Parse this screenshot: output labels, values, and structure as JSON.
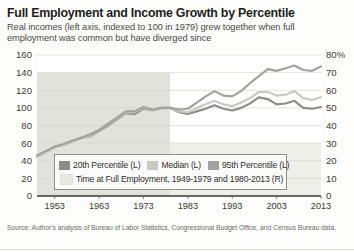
{
  "header": {
    "title": "Full Employment and Income Growth by Percentile",
    "subtitle": "Real incomes (left axis, indexed to 100 in 1979) grew together when full employment was common but have diverged since"
  },
  "source": {
    "text": "Source: Author's analysis of Bureau of Labor Statistics, Congressional Budget Office, and Census Bureau data."
  },
  "legend": {
    "items": [
      {
        "label": "20th Percentile (L)",
        "color": "#8d8d88"
      },
      {
        "label": "Median (L)",
        "color": "#c9c9c3"
      },
      {
        "label": "95th Percentile (L)",
        "color": "#a3a39d"
      },
      {
        "label": "Time at Full Employment, 1949-1979 and 1980-2013 (R)",
        "color": "#e8e8e2"
      }
    ]
  },
  "chart_data": {
    "type": "line",
    "title": "Full Employment and Income Growth by Percentile",
    "subtitle": "Real incomes (left axis, indexed to 100 in 1979) grew together when full employment was common but have diverged since",
    "xlabel": "",
    "ylabel": "",
    "y2label": "",
    "xlim": [
      1949,
      2013
    ],
    "ylim": [
      0,
      160
    ],
    "y2lim": [
      0,
      80
    ],
    "yticks": [
      0,
      20,
      40,
      60,
      80,
      100,
      120,
      140,
      160
    ],
    "ytick_labels": [
      "0",
      "20",
      "40",
      "60",
      "80",
      "100",
      "120",
      "140",
      "160"
    ],
    "y2ticks": [
      0,
      10,
      20,
      30,
      40,
      50,
      60,
      70,
      80
    ],
    "y2tick_labels": [
      "0",
      "10",
      "20",
      "30",
      "40",
      "50",
      "60",
      "70",
      "80%"
    ],
    "xticks": [
      1953,
      1963,
      1973,
      1983,
      1993,
      2003,
      2013
    ],
    "xtick_labels": [
      "1953",
      "1963",
      "1973",
      "1983",
      "1993",
      "2003",
      "2013"
    ],
    "grid": true,
    "legend_position": "inside-bottom-left",
    "bands": [
      {
        "name": "Time at Full Employment, 1949-1979",
        "x0": 1949,
        "x1": 1979,
        "value": 70,
        "color": "#e2e2dc"
      },
      {
        "name": "Time at Full Employment, 1980-2013",
        "x0": 1979,
        "x1": 2013,
        "value": 30,
        "color": "#efefe9"
      }
    ],
    "x": [
      1949,
      1951,
      1953,
      1955,
      1957,
      1959,
      1961,
      1963,
      1965,
      1967,
      1969,
      1971,
      1973,
      1975,
      1977,
      1979,
      1981,
      1983,
      1985,
      1987,
      1989,
      1991,
      1993,
      1995,
      1997,
      1999,
      2001,
      2003,
      2005,
      2007,
      2009,
      2011,
      2013
    ],
    "series": [
      {
        "name": "20th Percentile (L)",
        "color": "#8d8d88",
        "axis": "left",
        "values": [
          45,
          50,
          56,
          58,
          62,
          66,
          68,
          74,
          80,
          87,
          94,
          93,
          99,
          97,
          100,
          100,
          95,
          93,
          96,
          99,
          103,
          99,
          97,
          100,
          105,
          112,
          110,
          104,
          105,
          108,
          100,
          99,
          101
        ]
      },
      {
        "name": "Median (L)",
        "color": "#c9c9c3",
        "axis": "left",
        "values": [
          44,
          49,
          55,
          58,
          62,
          65,
          69,
          75,
          81,
          88,
          95,
          95,
          100,
          97,
          99,
          100,
          96,
          95,
          100,
          104,
          108,
          104,
          102,
          106,
          111,
          118,
          118,
          114,
          115,
          119,
          111,
          109,
          112
        ]
      },
      {
        "name": "95th Percentile (L)",
        "color": "#a3a39d",
        "axis": "left",
        "values": [
          46,
          51,
          56,
          59,
          63,
          66,
          70,
          75,
          82,
          89,
          96,
          96,
          101,
          98,
          100,
          100,
          98,
          99,
          106,
          113,
          119,
          114,
          113,
          119,
          128,
          136,
          144,
          142,
          145,
          148,
          143,
          142,
          147
        ]
      }
    ]
  }
}
